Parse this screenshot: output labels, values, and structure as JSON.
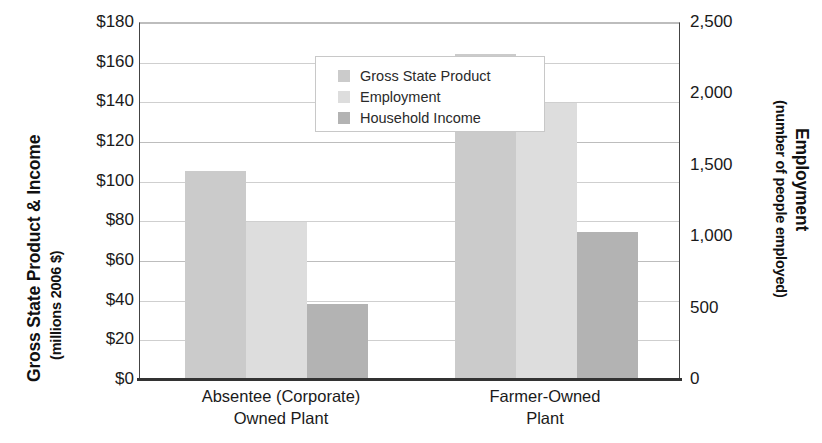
{
  "chart_data": {
    "type": "bar",
    "title": "",
    "categories": [
      "Absentee (Corporate) Owned Plant",
      "Farmer-Owned Plant"
    ],
    "category_lines": [
      [
        "Absentee (Corporate)",
        "Owned Plant"
      ],
      [
        "Farmer-Owned",
        "Plant"
      ]
    ],
    "series": [
      {
        "name": "Gross State Product",
        "axis": "left",
        "unit": "millions 2006 $",
        "color": "#cbcbcb",
        "values": [
          105,
          164
        ]
      },
      {
        "name": "Employment",
        "axis": "right",
        "unit": "number of people employed",
        "color": "#dddddd",
        "values": [
          1100,
          1930
        ]
      },
      {
        "name": "Household Income",
        "axis": "left",
        "unit": "millions 2006 $",
        "color": "#b3b3b3",
        "values": [
          38,
          74
        ]
      }
    ],
    "left_axis": {
      "label_line1": "Gross State Product & Income",
      "label_line2": "(millions 2006 $)",
      "ticks": [
        "$180",
        "$160",
        "$140",
        "$120",
        "$100",
        "$80",
        "$60",
        "$40",
        "$20",
        "$0"
      ],
      "tick_values": [
        180,
        160,
        140,
        120,
        100,
        80,
        60,
        40,
        20,
        0
      ],
      "ylim": [
        0,
        180
      ]
    },
    "right_axis": {
      "label_line1": "Employment",
      "label_line2": "(number of people employed)",
      "ticks": [
        "2,500",
        "2,000",
        "1,500",
        "1,000",
        "500",
        "0"
      ],
      "tick_values": [
        2500,
        2000,
        1500,
        1000,
        500,
        0
      ],
      "ylim": [
        0,
        2500
      ]
    },
    "grid": true,
    "legend_position": "upper-left-inside",
    "legend_entries": [
      "Gross State Product",
      "Employment",
      "Household Income"
    ]
  },
  "legend": {
    "items": [
      {
        "label": "Gross State Product",
        "color": "#cbcbcb"
      },
      {
        "label": "Employment",
        "color": "#dddddd"
      },
      {
        "label": "Household Income",
        "color": "#b3b3b3"
      }
    ]
  }
}
